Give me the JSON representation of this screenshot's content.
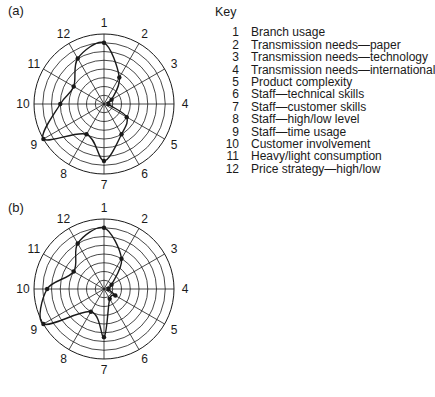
{
  "chart_data": [
    {
      "type": "radar",
      "panel": "(a)",
      "axes": [
        "1",
        "2",
        "3",
        "4",
        "5",
        "6",
        "7",
        "8",
        "9",
        "10",
        "11",
        "12"
      ],
      "rings": 8,
      "values": [
        7,
        3.5,
        1,
        0.5,
        3,
        4,
        6.5,
        4,
        8,
        5,
        4,
        6
      ],
      "grid": true
    },
    {
      "type": "radar",
      "panel": "(b)",
      "axes": [
        "1",
        "2",
        "3",
        "4",
        "5",
        "6",
        "7",
        "8",
        "9",
        "10",
        "11",
        "12"
      ],
      "rings": 8,
      "values": [
        7,
        4,
        1,
        0.5,
        1.5,
        1.3,
        5.5,
        3,
        8,
        6.5,
        4,
        6
      ],
      "grid": true
    }
  ],
  "panels": {
    "a_label": "(a)",
    "b_label": "(b)"
  },
  "key": {
    "title": "Key",
    "items": [
      {
        "num": "1",
        "label": "Branch usage"
      },
      {
        "num": "2",
        "label": "Transmission needs—paper"
      },
      {
        "num": "3",
        "label": "Transmission needs—technology"
      },
      {
        "num": "4",
        "label": "Transmission needs—international"
      },
      {
        "num": "5",
        "label": "Product complexity"
      },
      {
        "num": "6",
        "label": "Staff—technical skills"
      },
      {
        "num": "7",
        "label": "Staff—customer skills"
      },
      {
        "num": "8",
        "label": "Staff—high/low level"
      },
      {
        "num": "9",
        "label": "Staff—time usage"
      },
      {
        "num": "10",
        "label": "Customer involvement"
      },
      {
        "num": "11",
        "label": "Heavy/light consumption"
      },
      {
        "num": "12",
        "label": "Price strategy—high/low"
      }
    ]
  },
  "colors": {
    "line": "#1a1a1a",
    "grid": "#1a1a1a",
    "background": "#ffffff"
  }
}
